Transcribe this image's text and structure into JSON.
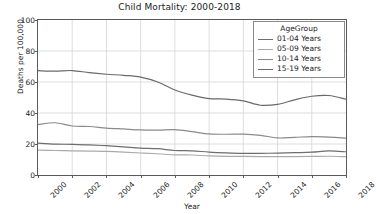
{
  "chart_data": {
    "type": "line",
    "title": "Child Mortality: 2000-2018",
    "xlabel": "Year",
    "ylabel": "Deaths per 100,000",
    "xlim": [
      2000,
      2018
    ],
    "ylim": [
      0,
      100
    ],
    "grid": true,
    "legend_position": "upper right",
    "legend_title": "AgeGroup",
    "x": [
      2000,
      2001,
      2002,
      2003,
      2004,
      2005,
      2006,
      2007,
      2008,
      2009,
      2010,
      2011,
      2012,
      2013,
      2014,
      2015,
      2016,
      2017,
      2018
    ],
    "xticks": [
      2000,
      2002,
      2004,
      2006,
      2008,
      2010,
      2012,
      2014,
      2016,
      2018
    ],
    "xticklabels": [
      "2000",
      "2002",
      "2004",
      "2006",
      "2008",
      "2010",
      "2012",
      "2014",
      "2016",
      "2018"
    ],
    "yticks": [
      0,
      20,
      40,
      60,
      80,
      100
    ],
    "yticklabels": [
      "0",
      "20",
      "40",
      "60",
      "80",
      "100"
    ],
    "series": [
      {
        "name": "01-04 Years",
        "color": "#6e6e6e",
        "values": [
          20.5,
          19.9,
          19.8,
          19.4,
          18.9,
          18.2,
          17.4,
          17.0,
          15.8,
          15.6,
          14.8,
          14.3,
          14.0,
          14.0,
          14.1,
          14.4,
          14.7,
          15.5,
          15.0
        ]
      },
      {
        "name": "05-09 Years",
        "color": "#aaaaaa",
        "values": [
          16.1,
          15.8,
          15.6,
          15.4,
          15.2,
          14.8,
          14.2,
          13.7,
          13.0,
          12.9,
          12.3,
          12.0,
          12.0,
          11.9,
          11.9,
          11.9,
          12.0,
          12.1,
          11.8
        ]
      },
      {
        "name": "10-14 Years",
        "color": "#8a8a8a",
        "values": [
          32.5,
          33.7,
          31.6,
          31.3,
          30.3,
          29.7,
          29.1,
          29.0,
          29.3,
          28.0,
          26.5,
          26.3,
          26.4,
          25.6,
          23.9,
          24.3,
          24.8,
          24.5,
          23.8
        ]
      },
      {
        "name": "15-19 Years",
        "color": "#6a6a6a",
        "values": [
          67.3,
          67.0,
          67.4,
          66.0,
          65.0,
          64.3,
          63.2,
          60.0,
          54.8,
          51.5,
          49.3,
          49.0,
          47.8,
          45.0,
          45.6,
          48.5,
          50.8,
          51.3,
          48.9
        ]
      }
    ]
  }
}
